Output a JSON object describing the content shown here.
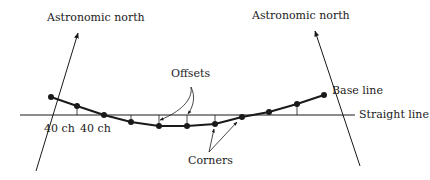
{
  "diagram": {
    "labels": {
      "north_left": "Astronomic north",
      "north_right": "Astronomic north",
      "offsets": "Offsets",
      "base_line": "Base line",
      "straight_line": "Straight line",
      "corners": "Corners",
      "chain_1": "40 ch",
      "chain_2": "40 ch"
    },
    "colors": {
      "ink": "#1a1a1a",
      "background": "#ffffff"
    },
    "base_line_points": [
      [
        51,
        97
      ],
      [
        77,
        106
      ],
      [
        104,
        115
      ],
      [
        131,
        122
      ],
      [
        159,
        126
      ],
      [
        187,
        126
      ],
      [
        215,
        124
      ],
      [
        242,
        117
      ],
      [
        269,
        112
      ],
      [
        297,
        104
      ],
      [
        324,
        95
      ]
    ]
  }
}
